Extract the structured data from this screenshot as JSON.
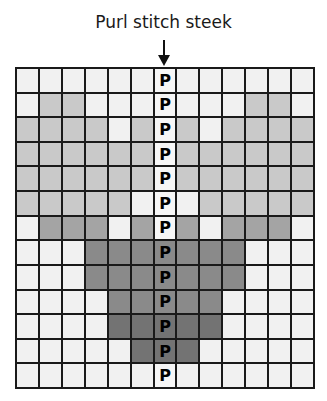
{
  "title": "Purl stitch steek",
  "legend": {
    "purl_symbol": "P"
  },
  "colors": {
    "W": "#f1f1f1",
    "L": "#c9c9c9",
    "M": "#a4a4a4",
    "D": "#8a8a8a",
    "X": "#737373",
    "grid_line": "#1a1a1a"
  },
  "chart": {
    "columns": 13,
    "rows": 13,
    "steek_column": 7,
    "cells": [
      [
        "W",
        "W",
        "W",
        "W",
        "W",
        "W",
        "P",
        "W",
        "W",
        "W",
        "W",
        "W",
        "W"
      ],
      [
        "W",
        "L",
        "L",
        "W",
        "W",
        "W",
        "P",
        "W",
        "W",
        "W",
        "L",
        "L",
        "W"
      ],
      [
        "L",
        "L",
        "L",
        "L",
        "W",
        "L",
        "P",
        "L",
        "W",
        "L",
        "L",
        "L",
        "L"
      ],
      [
        "L",
        "L",
        "L",
        "L",
        "L",
        "L",
        "P",
        "L",
        "L",
        "L",
        "L",
        "L",
        "L"
      ],
      [
        "L",
        "L",
        "L",
        "L",
        "L",
        "L",
        "P",
        "L",
        "L",
        "L",
        "L",
        "L",
        "L"
      ],
      [
        "L",
        "L",
        "L",
        "L",
        "L",
        "W",
        "P",
        "W",
        "L",
        "L",
        "L",
        "L",
        "L"
      ],
      [
        "W",
        "M",
        "M",
        "M",
        "W",
        "M",
        "P",
        "M",
        "W",
        "M",
        "M",
        "M",
        "W"
      ],
      [
        "W",
        "W",
        "W",
        "D",
        "D",
        "D",
        "PD",
        "D",
        "D",
        "D",
        "W",
        "W",
        "W"
      ],
      [
        "W",
        "W",
        "W",
        "D",
        "D",
        "D",
        "PD",
        "D",
        "D",
        "D",
        "W",
        "W",
        "W"
      ],
      [
        "W",
        "W",
        "W",
        "W",
        "D",
        "D",
        "PD",
        "D",
        "D",
        "W",
        "W",
        "W",
        "W"
      ],
      [
        "W",
        "W",
        "W",
        "W",
        "X",
        "X",
        "PX",
        "X",
        "X",
        "W",
        "W",
        "W",
        "W"
      ],
      [
        "W",
        "W",
        "W",
        "W",
        "W",
        "X",
        "PX",
        "X",
        "W",
        "W",
        "W",
        "W",
        "W"
      ],
      [
        "W",
        "W",
        "W",
        "W",
        "W",
        "W",
        "P",
        "W",
        "W",
        "W",
        "W",
        "W",
        "W"
      ]
    ]
  }
}
